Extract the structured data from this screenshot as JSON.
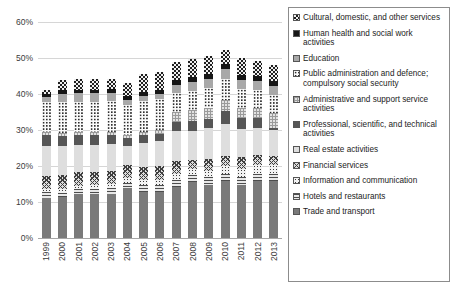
{
  "chart_data": {
    "type": "bar",
    "stacked": true,
    "title": "",
    "xlabel": "",
    "ylabel": "",
    "ylim": [
      0,
      60
    ],
    "ytick_labels": [
      "0%",
      "10%",
      "20%",
      "30%",
      "40%",
      "50%",
      "60%"
    ],
    "ytick_values": [
      0,
      10,
      20,
      30,
      40,
      50,
      60
    ],
    "grid": true,
    "legend_position": "right",
    "categories": [
      "1999",
      "2000",
      "2001",
      "2002",
      "2003",
      "2004",
      "2005",
      "2006",
      "2007",
      "2008",
      "2009",
      "2010",
      "2011",
      "2012",
      "2013"
    ],
    "series": [
      {
        "name": "Trade and transport",
        "pattern": "solid-grey",
        "values": [
          11.2,
          11.3,
          12.3,
          12.2,
          12.3,
          13.9,
          12.9,
          12.8,
          14.1,
          15.6,
          14.8,
          15.7,
          14.8,
          15.8,
          15.8
        ]
      },
      {
        "name": "Hotels and restaurants",
        "pattern": "horizontal-lines",
        "values": [
          1.6,
          1.3,
          1.2,
          1.4,
          1.6,
          1.5,
          1.7,
          1.8,
          1.9,
          2.0,
          2.1,
          2.1,
          2.1,
          1.9,
          1.9
        ]
      },
      {
        "name": "Information and communication",
        "pattern": "dotted-light",
        "values": [
          0.9,
          0.9,
          1.0,
          1.0,
          1.1,
          1.2,
          1.4,
          1.6,
          1.7,
          1.6,
          1.8,
          2.1,
          2.3,
          2.5,
          2.6
        ]
      },
      {
        "name": "Financial services",
        "pattern": "cross-hatch",
        "values": [
          3.6,
          3.9,
          3.8,
          3.7,
          3.6,
          3.8,
          3.6,
          3.9,
          3.7,
          2.5,
          3.2,
          2.9,
          3.4,
          2.9,
          2.5
        ]
      },
      {
        "name": "Real estate activities",
        "pattern": "light-grey-solid",
        "values": [
          8.4,
          8.1,
          7.6,
          7.5,
          7.4,
          5.3,
          6.9,
          6.9,
          8.2,
          7.9,
          8.6,
          9.0,
          7.8,
          7.5,
          7.2
        ]
      },
      {
        "name": "Professional, scientific, and technical activities",
        "pattern": "dark-grey-solid",
        "values": [
          3.0,
          2.9,
          2.8,
          2.7,
          2.7,
          2.1,
          2.0,
          2.0,
          2.7,
          2.9,
          2.7,
          3.5,
          2.9,
          2.8,
          0.6
        ]
      },
      {
        "name": "Administrative and support service activities",
        "pattern": "light-checker",
        "values": [
          0.8,
          0.8,
          0.8,
          0.9,
          0.9,
          0.8,
          1.0,
          1.0,
          2.6,
          3.0,
          2.9,
          3.0,
          2.7,
          2.8,
          4.0
        ]
      },
      {
        "name": "Public administration and defence; compulsory social security",
        "pattern": "white-dotted",
        "values": [
          8.4,
          8.5,
          8.4,
          8.5,
          8.4,
          8.4,
          8.5,
          8.5,
          5.4,
          5.4,
          5.6,
          6.0,
          5.5,
          5.0,
          5.0
        ]
      },
      {
        "name": "Education",
        "pattern": "medium-grey-solid",
        "values": [
          1.2,
          2.3,
          2.3,
          2.3,
          2.3,
          1.4,
          1.4,
          1.4,
          2.3,
          2.5,
          2.5,
          2.6,
          2.5,
          2.5,
          2.5
        ]
      },
      {
        "name": "Human health and social work activities",
        "pattern": "black-solid",
        "values": [
          0.9,
          1.0,
          1.0,
          1.0,
          1.0,
          1.1,
          1.1,
          1.1,
          1.2,
          1.3,
          1.4,
          1.4,
          1.4,
          1.4,
          1.4
        ]
      },
      {
        "name": "Cultural, domestic, and other services",
        "pattern": "checkerboard",
        "values": [
          1.0,
          3.0,
          3.0,
          3.0,
          3.0,
          3.5,
          5.0,
          5.0,
          5.0,
          5.0,
          5.0,
          4.0,
          4.6,
          4.0,
          4.5
        ]
      }
    ]
  },
  "legend": {
    "items": [
      {
        "label": "Cultural, domestic, and other services",
        "swatch": "checkerboard-swatch"
      },
      {
        "label": "Human health and social work activities",
        "swatch": "black-solid-swatch"
      },
      {
        "label": "Education",
        "swatch": "medium-grey-swatch"
      },
      {
        "label": "Public administration and defence; compulsory social security",
        "swatch": "white-dotted-swatch"
      },
      {
        "label": "Administrative and support service activities",
        "swatch": "light-checker-swatch"
      },
      {
        "label": "Professional, scientific, and technical activities",
        "swatch": "dark-grey-swatch"
      },
      {
        "label": "Real estate activities",
        "swatch": "light-grey-swatch"
      },
      {
        "label": "Financial services",
        "swatch": "cross-hatch-swatch"
      },
      {
        "label": "Information and communication",
        "swatch": "dotted-light-swatch"
      },
      {
        "label": "Hotels and restaurants",
        "swatch": "horizontal-lines-swatch"
      },
      {
        "label": "Trade and transport",
        "swatch": "solid-grey-swatch"
      }
    ]
  },
  "colors": {
    "gridline": "#d6d6d6",
    "axis": "#a6a6a6",
    "text": "#3b3b3b",
    "legend_border": "#8c8c8c",
    "background": "#ffffff"
  }
}
